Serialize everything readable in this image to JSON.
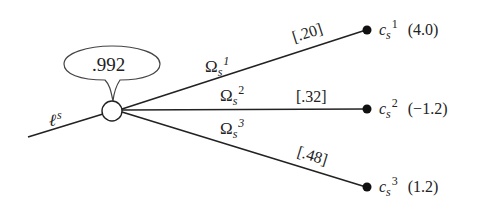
{
  "diagram": {
    "type": "decision-tree-chance-node",
    "colors": {
      "line": "#222222",
      "background": "#ffffff",
      "node_fill": "#ffffff",
      "terminal_fill": "#111111"
    },
    "incoming": {
      "label_main": "ℓ",
      "label_sup": "s"
    },
    "chance_node": {
      "bubble_value": ".992"
    },
    "branches": [
      {
        "event_main": "Ω",
        "event_sub": "s",
        "event_sup": "1",
        "probability": "[.20]",
        "outcome_main": "c",
        "outcome_sub": "s",
        "outcome_sup": "1",
        "outcome_value": "(4.0)"
      },
      {
        "event_main": "Ω",
        "event_sub": "s",
        "event_sup": "2",
        "probability": "[.32]",
        "outcome_main": "c",
        "outcome_sub": "s",
        "outcome_sup": "2",
        "outcome_value": "(−1.2)"
      },
      {
        "event_main": "Ω",
        "event_sub": "s",
        "event_sup": "3",
        "probability": "[.48]",
        "outcome_main": "c",
        "outcome_sub": "s",
        "outcome_sup": "3",
        "outcome_value": "(1.2)"
      }
    ]
  }
}
